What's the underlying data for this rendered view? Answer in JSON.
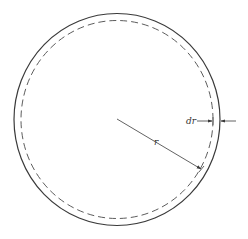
{
  "diagram": {
    "type": "annular ring of a circle",
    "center": {
      "x": 117,
      "y": 119
    },
    "outer_circle": {
      "rx": 103,
      "ry": 106,
      "style": "solid"
    },
    "inner_circle": {
      "rx": 96,
      "ry": 99,
      "style": "dashed"
    },
    "radius_arrow": {
      "from": {
        "x": 117,
        "y": 119
      },
      "to": {
        "x": 202,
        "y": 170
      }
    },
    "labels": {
      "radius": "r",
      "thickness": "dr"
    },
    "colors": {
      "stroke": "#3a3a3a",
      "background": "#ffffff"
    }
  }
}
